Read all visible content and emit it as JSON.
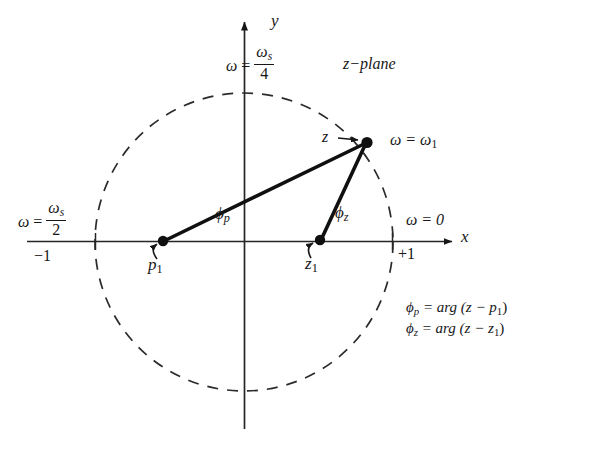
{
  "figure": {
    "kind": "z-plane pole-zero angle diagram",
    "plane_label": "z−plane",
    "background_color": "#ffffff",
    "ink_color": "#171717"
  },
  "axes": {
    "x_label": "x",
    "y_label": "y",
    "x_tick_left_label": "−1",
    "x_tick_right_label": "+1"
  },
  "frequency_labels": {
    "omega_symbol": "ω",
    "equals": "=",
    "omega_s_symbol": "ω",
    "omega_s_sub": "s",
    "at_top": {
      "numerator_sub": "s",
      "denominator": "4"
    },
    "at_left": {
      "numerator_sub": "s",
      "denominator": "2"
    },
    "at_right": {
      "text": "ω = 0"
    },
    "at_point_z": {
      "text": "ω = ω",
      "sub": "1"
    }
  },
  "points": {
    "z": {
      "label": "z",
      "arrow": "→",
      "x": 367,
      "y": 142
    },
    "p1": {
      "label": "p",
      "sub": "1",
      "x": 163,
      "y": 241
    },
    "z1": {
      "label": "z",
      "sub": "1",
      "x": 320,
      "y": 240
    }
  },
  "angles": {
    "phi_p": {
      "symbol": "ϕ",
      "sub": "p"
    },
    "phi_z": {
      "symbol": "ϕ",
      "sub": "z"
    }
  },
  "equations": {
    "phi_p": {
      "lhs_symbol": "ϕ",
      "lhs_sub": "p",
      "rhs": "= arg (z − p",
      "rhs_sub": "1",
      "rhs_end": ")"
    },
    "phi_z": {
      "lhs_symbol": "ϕ",
      "lhs_sub": "z",
      "rhs": "= arg (z − z",
      "rhs_sub": "1",
      "rhs_end": ")"
    }
  },
  "geometry": {
    "origin_x": 244,
    "origin_y": 242,
    "unit_circle_radius": 149,
    "unit_circle_style": "dashed"
  }
}
